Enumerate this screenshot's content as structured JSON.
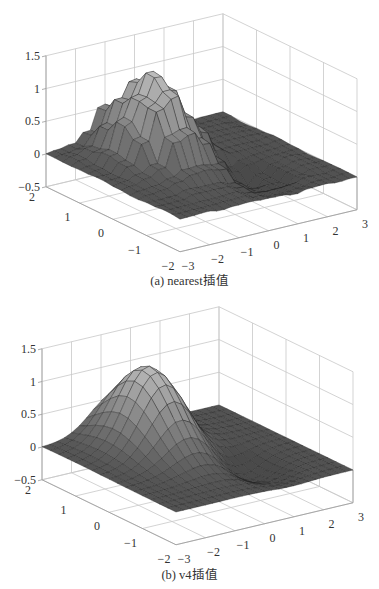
{
  "chart_data": [
    {
      "type": "surface3d",
      "title": "",
      "caption": "(a) nearest插值",
      "interpolation": "nearest",
      "xlabel": "",
      "ylabel": "",
      "zlabel": "",
      "x_ticks": [
        -3,
        -2,
        -1,
        0,
        1,
        2,
        3
      ],
      "y_ticks": [
        -2,
        -1,
        0,
        1,
        2
      ],
      "z_ticks": [
        -0.5,
        0,
        0.5,
        1,
        1.5
      ],
      "z_tick_labels": [
        "−0.5",
        "0",
        "0.5",
        "1",
        "1.5"
      ],
      "x_tick_labels": [
        "−3",
        "−2",
        "−1",
        "0",
        "1",
        "2",
        "3"
      ],
      "y_tick_labels": [
        "−2",
        "−1",
        "0",
        "1",
        "2"
      ],
      "xlim": [
        -3,
        3
      ],
      "ylim": [
        -2,
        2
      ],
      "zlim": [
        -0.5,
        1.5
      ],
      "grid": true,
      "surface_model": {
        "grid_x": 25,
        "grid_y": 17,
        "gaussians": [
          {
            "cx": -0.55,
            "cy": 0.95,
            "amp": 1.25,
            "sx": 0.75,
            "sy": 0.8
          },
          {
            "cx": 0.9,
            "cy": -0.6,
            "amp": -0.3,
            "sx": 0.55,
            "sy": 0.6
          }
        ],
        "jagged": true,
        "peak_value": 1.25,
        "dip_value": -0.3
      }
    },
    {
      "type": "surface3d",
      "title": "",
      "caption": "(b) v4插值",
      "interpolation": "v4",
      "xlabel": "",
      "ylabel": "",
      "zlabel": "",
      "x_ticks": [
        -3,
        -2,
        -1,
        0,
        1,
        2,
        3
      ],
      "y_ticks": [
        -2,
        -1,
        0,
        1,
        2
      ],
      "z_ticks": [
        -0.5,
        0,
        0.5,
        1,
        1.5
      ],
      "z_tick_labels": [
        "−0.5",
        "0",
        "0.5",
        "1",
        "1.5"
      ],
      "x_tick_labels": [
        "−3",
        "−2",
        "−1",
        "0",
        "1",
        "2",
        "3"
      ],
      "y_tick_labels": [
        "−2",
        "−1",
        "0",
        "1",
        "2"
      ],
      "xlim": [
        -3,
        3
      ],
      "ylim": [
        -2,
        2
      ],
      "zlim": [
        -0.5,
        1.5
      ],
      "grid": true,
      "surface_model": {
        "grid_x": 25,
        "grid_y": 17,
        "gaussians": [
          {
            "cx": -0.55,
            "cy": 0.95,
            "amp": 1.22,
            "sx": 0.8,
            "sy": 0.85
          },
          {
            "cx": 0.9,
            "cy": -0.6,
            "amp": -0.28,
            "sx": 0.6,
            "sy": 0.65
          }
        ],
        "jagged": false,
        "peak_value": 1.22,
        "dip_value": -0.28
      }
    }
  ],
  "figures": {
    "a": {
      "caption": "(a) nearest插值"
    },
    "b": {
      "caption": "(b) v4插值"
    }
  },
  "colors": {
    "grid": "#c8c8c8",
    "axis": "#9a9a9a",
    "surface_dark": "#4a4a4a",
    "surface_light": "#bdbdbd",
    "edge": "#1e1e1e"
  }
}
